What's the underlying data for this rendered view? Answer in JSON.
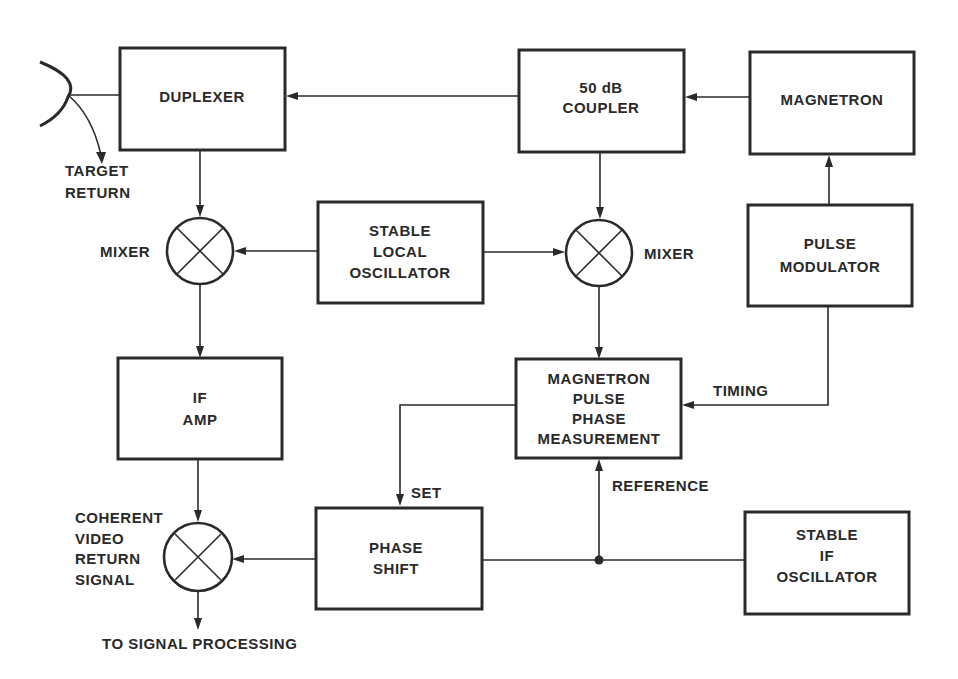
{
  "diagram": {
    "blocks": {
      "duplexer": [
        "DUPLEXER"
      ],
      "coupler": [
        "50 dB",
        "COUPLER"
      ],
      "magnetron": [
        "MAGNETRON"
      ],
      "stalo": [
        "STABLE",
        "LOCAL",
        "OSCILLATOR"
      ],
      "pulse_modulator": [
        "PULSE",
        "MODULATOR"
      ],
      "if_amp": [
        "IF",
        "AMP"
      ],
      "phase_meas": [
        "MAGNETRON",
        "PULSE",
        "PHASE",
        "MEASUREMENT"
      ],
      "phase_shift": [
        "PHASE",
        "SHIFT"
      ],
      "stable_if_osc": [
        "STABLE",
        "IF",
        "OSCILLATOR"
      ]
    },
    "labels": {
      "target_return": [
        "TARGET",
        "RETURN"
      ],
      "mixer_left": "MIXER",
      "mixer_right": "MIXER",
      "timing": "TIMING",
      "set": "SET",
      "reference": "REFERENCE",
      "coherent": [
        "COHERENT",
        "VIDEO",
        "RETURN",
        "SIGNAL"
      ],
      "to_signal_processing": "TO SIGNAL PROCESSING"
    },
    "colors": {
      "ink": "#2a2a2a",
      "background": "#ffffff"
    }
  }
}
